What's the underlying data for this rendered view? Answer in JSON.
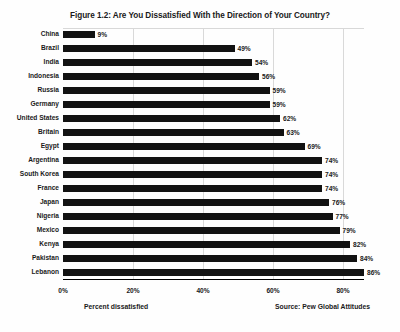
{
  "chart_data": {
    "type": "bar",
    "orientation": "horizontal",
    "title": "Figure 1.2: Are You Dissatisfied With the Direction of Your Country?",
    "xlabel": "Percent dissatisfied",
    "ylabel": "",
    "source": "Source: Pew Global Attitudes",
    "xlim": [
      0,
      86
    ],
    "grid": true,
    "grid_axis": "x",
    "legend": false,
    "xticks": [
      0,
      20,
      40,
      60,
      80
    ],
    "xticklabels": [
      "0%",
      "20%",
      "40%",
      "60%",
      "80%"
    ],
    "bar_color": "#121212",
    "categories": [
      "China",
      "Brazil",
      "India",
      "Indonesia",
      "Russia",
      "Germany",
      "United States",
      "Britain",
      "Egypt",
      "Argentina",
      "South Korea",
      "France",
      "Japan",
      "Nigeria",
      "Mexico",
      "Kenya",
      "Pakistan",
      "Lebanon"
    ],
    "values": [
      9,
      49,
      54,
      56,
      59,
      59,
      62,
      63,
      69,
      74,
      74,
      74,
      76,
      77,
      79,
      82,
      84,
      86
    ],
    "value_labels": [
      "9%",
      "49%",
      "54%",
      "56%",
      "59%",
      "59%",
      "62%",
      "63%",
      "69%",
      "74%",
      "74%",
      "74%",
      "76%",
      "77%",
      "79%",
      "82%",
      "84%",
      "86%"
    ]
  }
}
